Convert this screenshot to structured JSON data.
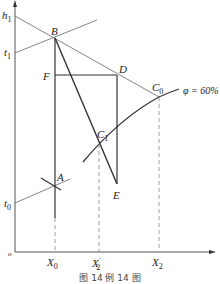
{
  "diagram": {
    "type": "psychrometric I-H diagram construction",
    "axes": {
      "y_axis_labels": [
        {
          "id": "h1",
          "text": "h",
          "sub": "1"
        },
        {
          "id": "t1",
          "text": "t",
          "sub": "1"
        },
        {
          "id": "t0",
          "text": "t",
          "sub": "0"
        }
      ],
      "origin": "o",
      "x_axis_labels": [
        {
          "id": "X0",
          "text": "X",
          "sub": "0"
        },
        {
          "id": "X2p",
          "text": "X",
          "sub": "2",
          "prime": "′"
        },
        {
          "id": "X2",
          "text": "X",
          "sub": "2"
        }
      ]
    },
    "points": {
      "A": "A",
      "B": "B",
      "C0": {
        "text": "C",
        "sub": "0"
      },
      "C1": {
        "text": "C",
        "sub": "1"
      },
      "D": "D",
      "E": "E",
      "F": "F"
    },
    "curve_label": "φ = 60%",
    "caption": "图 14   例 14 图"
  },
  "colors": {
    "line": "#333333",
    "thin_line": "#555555",
    "dashed": "#888888"
  }
}
